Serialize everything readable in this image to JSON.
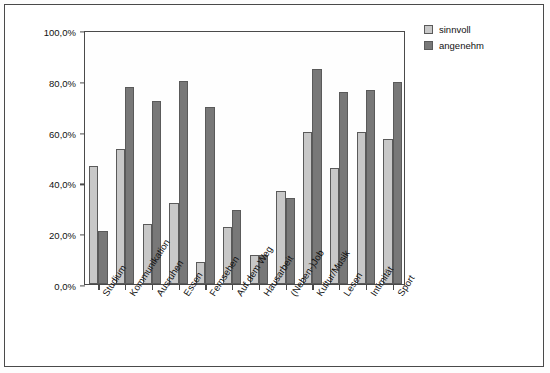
{
  "chart_data": {
    "type": "bar",
    "title": "",
    "xlabel": "",
    "ylabel": "Prozent, die als sinnvoll/angenehm erlebt werden",
    "ylim": [
      0,
      100
    ],
    "ytick_labels": [
      "0,0%",
      "20,0%",
      "40,0%",
      "60,0%",
      "80,0%",
      "100,0%"
    ],
    "ytick_values": [
      0,
      20,
      40,
      60,
      80,
      100
    ],
    "grid": false,
    "legend_position": "top-right",
    "categories": [
      "Studium",
      "Kommunikation",
      "Ausruhen",
      "Essen",
      "Fernsehen",
      "Auf dem Weg",
      "Hausarbeit",
      "(Neben-)Job",
      "Kultur/Musik",
      "Lesen",
      "Intimität",
      "Sport"
    ],
    "series": [
      {
        "name": "sinnvoll",
        "color": "#c8c8c8",
        "values": [
          46.5,
          53.0,
          23.5,
          32.0,
          8.8,
          22.5,
          11.5,
          36.5,
          60.0,
          45.5,
          60.0,
          57.0
        ]
      },
      {
        "name": "angenehm",
        "color": "#787878",
        "values": [
          21.0,
          77.5,
          72.0,
          80.0,
          69.5,
          29.0,
          11.5,
          34.0,
          84.5,
          75.5,
          76.5,
          79.5
        ]
      }
    ]
  },
  "legend": {
    "items": [
      {
        "label": "sinnvoll"
      },
      {
        "label": "angenehm"
      }
    ]
  }
}
